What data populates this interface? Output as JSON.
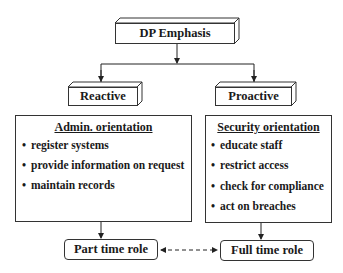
{
  "diagram": {
    "root": {
      "label": "DP Emphasis"
    },
    "branches": [
      {
        "label": "Reactive",
        "panel": {
          "title": "Admin.  orientation",
          "items": [
            "register systems",
            "provide information on request",
            "maintain records"
          ]
        },
        "role": "Part time role"
      },
      {
        "label": "Proactive",
        "panel": {
          "title": "Security orientation",
          "items": [
            "educate staff",
            "restrict access",
            "check for compliance",
            "act on breaches"
          ]
        },
        "role": "Full time role"
      }
    ],
    "bullet": "•",
    "role_link": "bidirectional-dashed"
  }
}
